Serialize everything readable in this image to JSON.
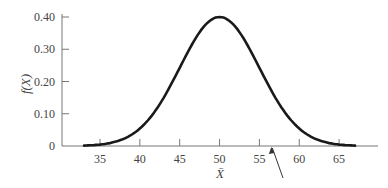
{
  "chart_data": {
    "type": "line",
    "title": "",
    "xlabel": "X̄",
    "ylabel": "f(X)",
    "x_ticks": [
      35,
      40,
      45,
      50,
      55,
      60,
      65
    ],
    "y_ticks": [
      "0",
      "0.10",
      "0.20",
      "0.30",
      "0.40"
    ],
    "xlim": [
      33,
      67
    ],
    "ylim": [
      0,
      0.4
    ],
    "grid": false,
    "legend": null,
    "series": [
      {
        "name": "normal density",
        "mean": 50,
        "std": 5,
        "peak": 0.4,
        "x": [
          33,
          35,
          40,
          45,
          50,
          55,
          60,
          65,
          67
        ],
        "values": [
          0.002,
          0.004,
          0.054,
          0.243,
          0.4,
          0.243,
          0.054,
          0.004,
          0.002
        ]
      }
    ],
    "annotations": [
      {
        "type": "arrow",
        "points_to_x": 56.5,
        "description": "arrow pointing to x-axis near 56.5"
      }
    ],
    "colors": {
      "curve": "#1a1a1a",
      "axis": "#777777",
      "text": "#444444"
    }
  }
}
